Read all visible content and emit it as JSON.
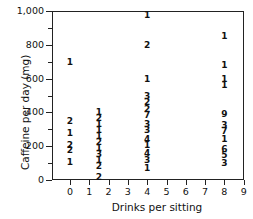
{
  "chart_data": {
    "type": "scatter",
    "subtype": "numeric-count-scatter",
    "title": "",
    "xlabel": "Drinks per sitting",
    "ylabel": "Caffeine per day (mg)",
    "xlim": [
      -0.5,
      9
    ],
    "ylim": [
      0,
      1000
    ],
    "x_ticks": [
      0,
      1,
      2,
      3,
      4,
      5,
      6,
      7,
      8,
      9
    ],
    "y_ticks": [
      0,
      200,
      400,
      600,
      800,
      1000
    ],
    "y_tick_labels": [
      "0",
      "200",
      "400",
      "600",
      "800",
      "1,000"
    ],
    "y_minor_ticks": [
      100,
      300,
      500,
      700,
      900
    ],
    "grid": false,
    "legend": null,
    "note": "Points are rendered as digits showing the count of observations at each location",
    "points": [
      {
        "x": 0,
        "y": 700,
        "count": 1
      },
      {
        "x": 0,
        "y": 350,
        "count": 2
      },
      {
        "x": 0,
        "y": 280,
        "count": 1
      },
      {
        "x": 0,
        "y": 210,
        "count": 2
      },
      {
        "x": 0,
        "y": 175,
        "count": 2
      },
      {
        "x": 0,
        "y": 105,
        "count": 1
      },
      {
        "x": 1.5,
        "y": 400,
        "count": 1
      },
      {
        "x": 1.5,
        "y": 365,
        "count": 2
      },
      {
        "x": 1.5,
        "y": 330,
        "count": 1
      },
      {
        "x": 1.5,
        "y": 295,
        "count": 1
      },
      {
        "x": 1.5,
        "y": 260,
        "count": 1
      },
      {
        "x": 1.5,
        "y": 225,
        "count": 2
      },
      {
        "x": 1.5,
        "y": 190,
        "count": 1
      },
      {
        "x": 1.5,
        "y": 155,
        "count": 3
      },
      {
        "x": 1.5,
        "y": 120,
        "count": 1
      },
      {
        "x": 1.5,
        "y": 85,
        "count": 2
      },
      {
        "x": 1.5,
        "y": 20,
        "count": 2
      },
      {
        "x": 4,
        "y": 975,
        "count": 1
      },
      {
        "x": 4,
        "y": 800,
        "count": 2
      },
      {
        "x": 4,
        "y": 600,
        "count": 1
      },
      {
        "x": 4,
        "y": 495,
        "count": 3
      },
      {
        "x": 4,
        "y": 460,
        "count": 2
      },
      {
        "x": 4,
        "y": 420,
        "count": 2
      },
      {
        "x": 4,
        "y": 385,
        "count": 7
      },
      {
        "x": 4,
        "y": 330,
        "count": 3
      },
      {
        "x": 4,
        "y": 295,
        "count": 3
      },
      {
        "x": 4,
        "y": 245,
        "count": 4
      },
      {
        "x": 4,
        "y": 210,
        "count": 1
      },
      {
        "x": 4,
        "y": 160,
        "count": 4
      },
      {
        "x": 4,
        "y": 120,
        "count": 3
      },
      {
        "x": 4,
        "y": 70,
        "count": 1
      },
      {
        "x": 8,
        "y": 855,
        "count": 1
      },
      {
        "x": 8,
        "y": 680,
        "count": 1
      },
      {
        "x": 8,
        "y": 595,
        "count": 1
      },
      {
        "x": 8,
        "y": 560,
        "count": 1
      },
      {
        "x": 8,
        "y": 390,
        "count": 9
      },
      {
        "x": 8,
        "y": 325,
        "count": 3
      },
      {
        "x": 8,
        "y": 290,
        "count": 7
      },
      {
        "x": 8,
        "y": 240,
        "count": 1
      },
      {
        "x": 8,
        "y": 185,
        "count": 6
      },
      {
        "x": 8,
        "y": 145,
        "count": 5
      },
      {
        "x": 8,
        "y": 100,
        "count": 3
      }
    ]
  }
}
